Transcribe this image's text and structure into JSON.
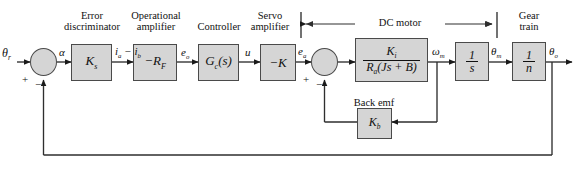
{
  "diagram": {
    "fill_color": "#d5d5d5",
    "line_color": "#4a4a4a"
  },
  "inputs": {
    "reference": "θ",
    "reference_sub": "r",
    "output": "θ",
    "output_sub": "o"
  },
  "group_labels": {
    "error_discriminator": "Error\ndiscriminator",
    "error_discriminator_l1": "Error",
    "error_discriminator_l2": "discriminator",
    "op_amp_l1": "Operational",
    "op_amp_l2": "amplifier",
    "controller": "Controller",
    "servo_l1": "Servo",
    "servo_l2": "amplifier",
    "dc_motor": "DC motor",
    "gear_l1": "Gear",
    "gear_l2": "train",
    "back_emf": "Back emf"
  },
  "blocks": [
    {
      "id": "ks",
      "label": "K",
      "sub": "s",
      "name": "block-ks"
    },
    {
      "id": "rf",
      "label": "−R",
      "sub": "F",
      "name": "block-minus-rf"
    },
    {
      "id": "gc",
      "label": "G",
      "sub": "c",
      "tail": "(s)",
      "name": "block-gc-s"
    },
    {
      "id": "minusk",
      "label": "−K",
      "sub": "",
      "name": "block-minus-k"
    },
    {
      "id": "motor",
      "num": "K",
      "num_sub": "i",
      "den": "R",
      "den_sub": "a",
      "den_tail": "(Js + B)",
      "name": "block-motor-transfer"
    },
    {
      "id": "integrator",
      "num": "1",
      "den": "s",
      "name": "block-integrator"
    },
    {
      "id": "gear",
      "num": "1",
      "den": "n",
      "name": "block-gear-ratio"
    },
    {
      "id": "kb",
      "label": "K",
      "sub": "b",
      "name": "block-kb"
    }
  ],
  "signals": {
    "alpha": "α",
    "current_diff": "i",
    "current_diff_sub_a": "a",
    "current_diff_minus": " − ",
    "current_diff_sub_b": "b",
    "e_o": "e",
    "e_o_sub": "o",
    "u": "u",
    "e_a": "e",
    "e_a_sub": "a",
    "omega_m": "ω",
    "omega_m_sub": "m",
    "theta_m": "θ",
    "theta_m_sub": "m",
    "theta_o": "θ",
    "theta_o_sub": "o"
  },
  "summing_junctions": [
    {
      "id": "sum1",
      "name": "summing-junction-input",
      "plus": "+",
      "minus": "−"
    },
    {
      "id": "sum2",
      "name": "summing-junction-backemf",
      "plus": "+",
      "minus": "−"
    }
  ]
}
